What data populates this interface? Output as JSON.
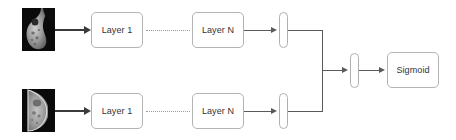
{
  "diagram": {
    "type": "flowchart",
    "colors": {
      "node_border": "#b3b3b3",
      "edge": "#5a5a5a",
      "input_edge": "#3a3a3a",
      "text": "#333333",
      "background": "#ffffff",
      "thumbnail_background": "#0a0a0a"
    },
    "branches": {
      "top": {
        "input_label": "mammogram-thumbnail-top",
        "first_layer": "Layer 1",
        "last_layer": "Layer N",
        "feature_bar": "feature-vector-top"
      },
      "bottom": {
        "input_label": "mammogram-thumbnail-bottom",
        "first_layer": "Layer 1",
        "last_layer": "Layer N",
        "feature_bar": "feature-vector-bottom"
      }
    },
    "merge": {
      "label": "concatenation-junction",
      "dense_bar": "merged-dense-vector"
    },
    "output": {
      "label": "Sigmoid"
    },
    "connector": {
      "ellipsis_style": "dotted"
    }
  }
}
